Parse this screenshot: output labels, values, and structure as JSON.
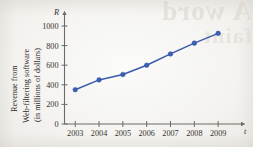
{
  "figure": {
    "y_axis_caption_lines": [
      "Revenue from",
      "Web-filtering software",
      "(in millions of dollars)"
    ],
    "y_axis_symbol": "R",
    "x_axis_symbol": "t",
    "page_showthrough": {
      "line1": "A word",
      "line2": "faint"
    }
  },
  "chart_data": {
    "type": "line",
    "title": "",
    "xlabel": "t",
    "ylabel": "R",
    "categories": [
      "2003",
      "2004",
      "2005",
      "2006",
      "2007",
      "2008",
      "2009"
    ],
    "x": [
      2003,
      2004,
      2005,
      2006,
      2007,
      2008,
      2009
    ],
    "values": [
      350,
      450,
      505,
      600,
      715,
      825,
      925
    ],
    "series": [
      {
        "name": "Revenue from Web-filtering software (in millions of dollars)",
        "values": [
          350,
          450,
          505,
          600,
          715,
          825,
          925
        ],
        "color": "#3a5fb5",
        "marker": "circle"
      }
    ],
    "yticks": [
      0,
      200,
      400,
      600,
      800,
      1000
    ],
    "ytick_labels": [
      "0",
      "200",
      "400",
      "600",
      "800",
      "1000"
    ],
    "xtick_labels": [
      "2003",
      "2004",
      "2005",
      "2006",
      "2007",
      "2008",
      "2009"
    ],
    "ylim": [
      0,
      1100
    ],
    "xlim": [
      2002.55,
      2009.75
    ],
    "grid": false,
    "legend": "none",
    "axis_arrows": true
  }
}
